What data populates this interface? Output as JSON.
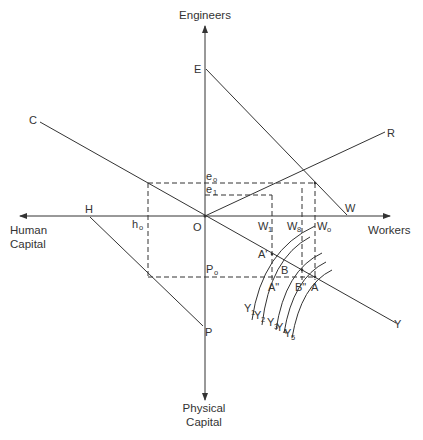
{
  "diagram": {
    "axes": {
      "up": "Engineers",
      "right": "Workers",
      "left_line1": "Human",
      "left_line2": "Capital",
      "down_line1": "Physical",
      "down_line2": "Capital"
    },
    "points": {
      "E": "E",
      "C": "C",
      "R": "R",
      "W": "W",
      "H": "H",
      "P": "P",
      "O": "O",
      "Y": "Y"
    },
    "markers": {
      "e0": {
        "main": "e",
        "sub": "o"
      },
      "e1": {
        "main": "e",
        "sub": "1"
      },
      "h0": {
        "main": "h",
        "sub": "o"
      },
      "P0": {
        "main": "P",
        "sub": "o"
      },
      "W1": {
        "main": "W",
        "sub": "1"
      },
      "W8": {
        "main": "W",
        "sub": "8"
      },
      "W0": {
        "main": "W",
        "sub": "o"
      }
    },
    "intersections": {
      "A_prime": "A'",
      "A_double": "A\"",
      "A": "A",
      "B": "B",
      "B_double": "B\""
    },
    "isoquants": [
      {
        "main": "Y",
        "sub": "1"
      },
      {
        "main": "Y",
        "sub": "2"
      },
      {
        "main": "Y",
        "sub": "3"
      },
      {
        "main": "Y",
        "sub": "4"
      },
      {
        "main": "Y",
        "sub": "5"
      }
    ],
    "colors": {
      "ink": "#333333",
      "background": "#ffffff"
    }
  }
}
